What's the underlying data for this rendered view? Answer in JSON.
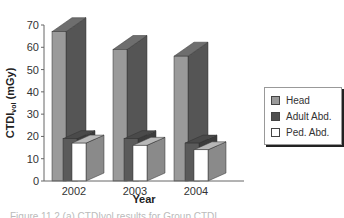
{
  "chart_data": {
    "type": "bar",
    "style": "3d-clustered-column",
    "title": "",
    "xlabel": "Year",
    "ylabel": "CTDIvol (mGy)",
    "ylabel_main": "CTDI",
    "ylabel_sub": "vol",
    "ylabel_unit": " (mGy)",
    "categories": [
      "2002",
      "2003",
      "2004"
    ],
    "series": [
      {
        "name": "Head",
        "values": [
          67,
          59,
          56
        ],
        "color_front": "#9a9a9a",
        "color_side": "#555555",
        "color_top": "#6e6e6e"
      },
      {
        "name": "Adult Abd.",
        "values": [
          19,
          19,
          17
        ],
        "color_front": "#5a5a5a",
        "color_side": "#3c3c3c",
        "color_top": "#4a4a4a"
      },
      {
        "name": "Ped. Abd.",
        "values": [
          17,
          16,
          14
        ],
        "color_front": "#ffffff",
        "color_side": "#8a8a8a",
        "color_top": "#b8b8b8"
      }
    ],
    "ylim": [
      0,
      70
    ],
    "yticks": [
      "0",
      "10",
      "20",
      "30",
      "40",
      "50",
      "60",
      "70"
    ],
    "grid": false,
    "legend_position": "right"
  },
  "legend": {
    "items": [
      {
        "label": "Head",
        "color": "#9a9a9a"
      },
      {
        "label": "Adult Abd.",
        "color": "#505050"
      },
      {
        "label": "Ped. Abd.",
        "color": "#ffffff"
      }
    ]
  },
  "caption": "Figure 11.2 (a) CTDIvol results for Group CTDI"
}
